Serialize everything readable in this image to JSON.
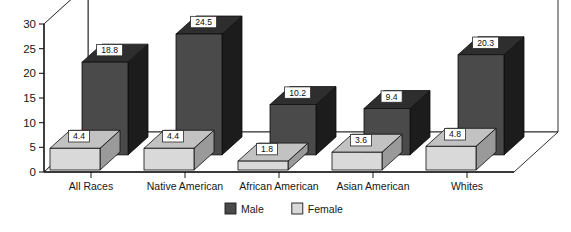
{
  "chart_data": {
    "type": "bar",
    "title": "",
    "subtitle": "",
    "xlabel": "",
    "ylabel": "",
    "categories": [
      "All Races",
      "Native American",
      "African American",
      "Asian American",
      "Whites"
    ],
    "series": [
      {
        "name": "Male",
        "values": [
          18.8,
          24.5,
          10.2,
          9.4,
          20.3
        ],
        "color": "#4a4a4a"
      },
      {
        "name": "Female",
        "values": [
          4.4,
          4.4,
          1.8,
          3.6,
          4.8
        ],
        "color": "#d9d9d9"
      }
    ],
    "ylim": [
      0,
      30
    ],
    "yticks": [
      0,
      5,
      10,
      15,
      20,
      25,
      30
    ],
    "ytick_labels": [
      "0",
      "5",
      "10",
      "15",
      "20",
      "25",
      "30"
    ],
    "grid": true,
    "legend_position": "bottom",
    "projection": "3d",
    "value_labels_shown": true
  },
  "legend": {
    "items": [
      {
        "label": "Male",
        "swatch": "#4a4a4a"
      },
      {
        "label": "Female",
        "swatch": "#d9d9d9"
      }
    ]
  },
  "colors": {
    "male_front": "#4a4a4a",
    "male_side": "#1c1c1c",
    "male_top": "#2e2e2e",
    "female_front": "#d9d9d9",
    "female_side": "#9a9a9a",
    "female_top": "#c2c2c2",
    "axis": "#1a1a1a",
    "grid": "#7a7a7a",
    "floor": "#ffffff",
    "label_box_fill": "#ffffff",
    "label_box_stroke": "#2a2a2a",
    "background": "#ffffff"
  }
}
